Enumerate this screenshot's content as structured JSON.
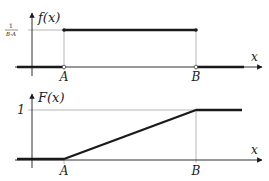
{
  "diagram": {
    "colors": {
      "curve": "#1a1a1a",
      "axis": "#1a1a1a",
      "guide": "#9a9a9a",
      "background": "#ffffff"
    },
    "top_panel": {
      "y_axis_label": "f(x)",
      "x_axis_label": "x",
      "level_label_num": "1",
      "level_label_den": "B-A",
      "point_a_label": "A",
      "point_b_label": "B"
    },
    "bottom_panel": {
      "y_axis_label": "F(x)",
      "x_axis_label": "x",
      "level_label": "1",
      "point_a_label": "A",
      "point_b_label": "B"
    }
  }
}
